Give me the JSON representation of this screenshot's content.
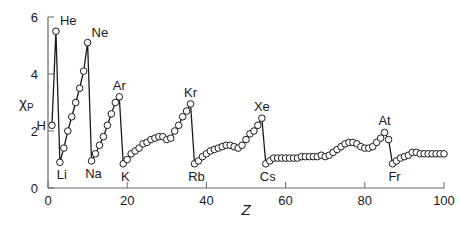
{
  "chart_data": {
    "type": "line",
    "title": "",
    "xlabel": "Z",
    "ylabel": "χP",
    "ylabel_main": "χ",
    "ylabel_sub": "P",
    "xlim": [
      0,
      100
    ],
    "ylim": [
      0,
      6
    ],
    "xticks": [
      0,
      20,
      40,
      60,
      80,
      100
    ],
    "yticks": [
      0,
      2,
      4,
      6
    ],
    "grid": false,
    "legend": null,
    "series": [
      {
        "name": "Pauling electronegativity",
        "marker": "open-circle",
        "x": [
          1,
          2,
          3,
          4,
          5,
          6,
          7,
          8,
          9,
          10,
          11,
          12,
          13,
          14,
          15,
          16,
          17,
          18,
          19,
          20,
          21,
          22,
          23,
          24,
          25,
          26,
          27,
          28,
          29,
          30,
          31,
          32,
          33,
          34,
          35,
          36,
          37,
          38,
          39,
          40,
          41,
          42,
          43,
          44,
          45,
          46,
          47,
          48,
          49,
          50,
          51,
          52,
          53,
          54,
          55,
          56,
          57,
          58,
          59,
          60,
          61,
          62,
          63,
          64,
          65,
          66,
          67,
          68,
          69,
          70,
          71,
          72,
          73,
          74,
          75,
          76,
          77,
          78,
          79,
          80,
          81,
          82,
          83,
          84,
          85,
          86,
          87,
          88,
          89,
          90,
          91,
          92,
          93,
          94,
          95,
          96,
          97,
          98,
          99,
          100
        ],
        "values": [
          2.2,
          5.5,
          0.9,
          1.4,
          2.0,
          2.5,
          3.0,
          3.5,
          4.1,
          5.1,
          0.95,
          1.2,
          1.5,
          1.8,
          2.2,
          2.6,
          3.0,
          3.2,
          0.85,
          1.0,
          1.2,
          1.3,
          1.4,
          1.55,
          1.6,
          1.7,
          1.75,
          1.8,
          1.8,
          1.7,
          1.75,
          2.0,
          2.2,
          2.5,
          2.7,
          2.95,
          0.85,
          0.95,
          1.1,
          1.2,
          1.3,
          1.35,
          1.4,
          1.45,
          1.5,
          1.5,
          1.45,
          1.4,
          1.5,
          1.7,
          1.9,
          2.0,
          2.2,
          2.45,
          0.85,
          0.95,
          1.05,
          1.05,
          1.05,
          1.05,
          1.05,
          1.05,
          1.05,
          1.1,
          1.1,
          1.1,
          1.1,
          1.1,
          1.15,
          1.1,
          1.15,
          1.25,
          1.35,
          1.45,
          1.55,
          1.6,
          1.6,
          1.55,
          1.45,
          1.4,
          1.4,
          1.45,
          1.6,
          1.75,
          1.95,
          1.7,
          0.85,
          0.95,
          1.05,
          1.1,
          1.15,
          1.25,
          1.25,
          1.2,
          1.2,
          1.2,
          1.2,
          1.2,
          1.2,
          1.2
        ]
      }
    ],
    "annotations": [
      {
        "label": "H",
        "z": 1,
        "value": 2.2,
        "pos": "left"
      },
      {
        "label": "He",
        "z": 2,
        "value": 5.5,
        "pos": "above-right"
      },
      {
        "label": "Li",
        "z": 3,
        "value": 0.9,
        "pos": "below"
      },
      {
        "label": "Ne",
        "z": 10,
        "value": 5.1,
        "pos": "above-right"
      },
      {
        "label": "Na",
        "z": 11,
        "value": 0.95,
        "pos": "below"
      },
      {
        "label": "Ar",
        "z": 18,
        "value": 3.2,
        "pos": "above"
      },
      {
        "label": "K",
        "z": 19,
        "value": 0.85,
        "pos": "below"
      },
      {
        "label": "Kr",
        "z": 36,
        "value": 2.95,
        "pos": "above"
      },
      {
        "label": "Rb",
        "z": 37,
        "value": 0.85,
        "pos": "below"
      },
      {
        "label": "Xe",
        "z": 54,
        "value": 2.45,
        "pos": "above"
      },
      {
        "label": "Cs",
        "z": 55,
        "value": 0.85,
        "pos": "below"
      },
      {
        "label": "At",
        "z": 85,
        "value": 1.95,
        "pos": "above"
      },
      {
        "label": "Fr",
        "z": 87,
        "value": 0.85,
        "pos": "below"
      }
    ]
  },
  "layout": {
    "x0_px": 48,
    "x100_px": 444,
    "y0_px": 188,
    "y6_px": 17,
    "line_color": "#1a1a1a",
    "marker_fill": "#ffffff",
    "axis_color": "#666666"
  }
}
